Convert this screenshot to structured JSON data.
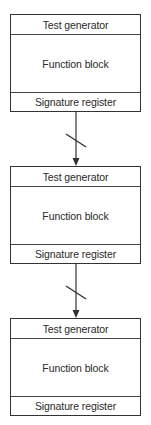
{
  "diagram": {
    "blocks": [
      {
        "test_generator": "Test generator",
        "function_block": "Function block",
        "signature_register": "Signature register"
      },
      {
        "test_generator": "Test generator",
        "function_block": "Function block",
        "signature_register": "Signature register"
      },
      {
        "test_generator": "Test generator",
        "function_block": "Function block",
        "signature_register": "Signature register"
      }
    ],
    "connections": [
      {
        "from": 0,
        "to": 1,
        "bus_slash": true,
        "arrow": true
      },
      {
        "from": 1,
        "to": 2,
        "bus_slash": true,
        "arrow": true
      }
    ]
  }
}
